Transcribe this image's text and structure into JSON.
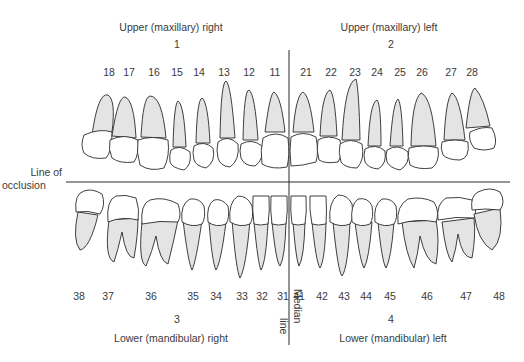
{
  "quadrants": {
    "upper_right": {
      "title": "Upper (maxillary) right",
      "number": "1",
      "teeth": [
        "18",
        "17",
        "16",
        "15",
        "14",
        "13",
        "12",
        "11"
      ]
    },
    "upper_left": {
      "title": "Upper (maxillary) left",
      "number": "2",
      "teeth": [
        "21",
        "22",
        "23",
        "24",
        "25",
        "26",
        "27",
        "28"
      ]
    },
    "lower_right": {
      "title": "Lower (mandibular) right",
      "number": "3",
      "teeth": [
        "38",
        "37",
        "36",
        "35",
        "34",
        "33",
        "32",
        "31"
      ]
    },
    "lower_left": {
      "title": "Lower (mandibular) left",
      "number": "4",
      "teeth": [
        "41",
        "42",
        "43",
        "44",
        "45",
        "46",
        "47",
        "48"
      ]
    }
  },
  "labels": {
    "line_of_occlusion_1": "Line of",
    "line_of_occlusion_2": "occlusion",
    "median_1": "Median",
    "median_2": "line"
  },
  "colors": {
    "line": "#2a2a2a",
    "root_fill": "#e4e4e4",
    "text": "#3a3a3a"
  }
}
